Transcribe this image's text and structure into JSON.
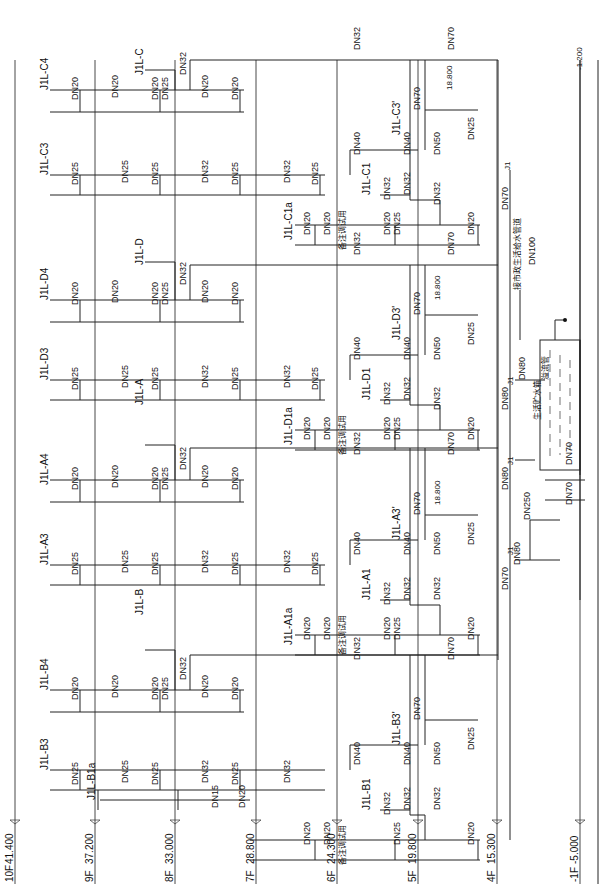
{
  "drawing": {
    "title": "Water supply riser system diagram",
    "floors": [
      {
        "label": "10F",
        "elev": "41.400",
        "x": 15
      },
      {
        "label": "9F",
        "elev": "37.200",
        "x": 95
      },
      {
        "label": "8F",
        "elev": "33.000",
        "x": 175
      },
      {
        "label": "7F",
        "elev": "28.800",
        "x": 256
      },
      {
        "label": "6F",
        "elev": "24.300",
        "x": 337
      },
      {
        "label": "5F",
        "elev": "19.800",
        "x": 418
      },
      {
        "label": "4F",
        "elev": "15.300",
        "x": 497
      },
      {
        "label": "-1F",
        "elev": "-5.000",
        "x": 580
      }
    ],
    "riser_labels": [
      {
        "text": "J1L-C4",
        "x": 48,
        "y": 90
      },
      {
        "text": "J1L-C",
        "x": 143,
        "y": 75
      },
      {
        "text": "J1L-C3",
        "x": 48,
        "y": 175
      },
      {
        "text": "J1L-D",
        "x": 143,
        "y": 265
      },
      {
        "text": "J1L-D4",
        "x": 48,
        "y": 300
      },
      {
        "text": "J1L-D3",
        "x": 48,
        "y": 380
      },
      {
        "text": "J1L-A",
        "x": 143,
        "y": 405
      },
      {
        "text": "J1L-A4",
        "x": 48,
        "y": 485
      },
      {
        "text": "J1L-A3",
        "x": 48,
        "y": 565
      },
      {
        "text": "J1L-B",
        "x": 143,
        "y": 615
      },
      {
        "text": "J1L-B4",
        "x": 48,
        "y": 690
      },
      {
        "text": "J1L-B3",
        "x": 48,
        "y": 770
      },
      {
        "text": "J1L-B1a",
        "x": 95,
        "y": 800
      },
      {
        "text": "J1L-C1a",
        "x": 292,
        "y": 240
      },
      {
        "text": "J1L-C1",
        "x": 370,
        "y": 195
      },
      {
        "text": "J1L-C3'",
        "x": 400,
        "y": 135
      },
      {
        "text": "J1L-D1a",
        "x": 292,
        "y": 445
      },
      {
        "text": "J1L-D1",
        "x": 370,
        "y": 400
      },
      {
        "text": "J1L-D3'",
        "x": 400,
        "y": 340
      },
      {
        "text": "J1L-A1a",
        "x": 292,
        "y": 645
      },
      {
        "text": "J1L-A1",
        "x": 370,
        "y": 600
      },
      {
        "text": "J1L-A3'",
        "x": 400,
        "y": 540
      },
      {
        "text": "J1L-B1",
        "x": 370,
        "y": 810
      },
      {
        "text": "J1L-B3'",
        "x": 400,
        "y": 745
      }
    ],
    "pipe_sizes": [
      {
        "t": "DN20",
        "x": 78,
        "y": 100
      },
      {
        "t": "DN20",
        "x": 118,
        "y": 98
      },
      {
        "t": "DN20",
        "x": 158,
        "y": 100
      },
      {
        "t": "DN25",
        "x": 168,
        "y": 100
      },
      {
        "t": "DN20",
        "x": 208,
        "y": 98
      },
      {
        "t": "DN20",
        "x": 238,
        "y": 100
      },
      {
        "t": "DN32",
        "x": 186,
        "y": 75
      },
      {
        "t": "DN25",
        "x": 78,
        "y": 185
      },
      {
        "t": "DN25",
        "x": 128,
        "y": 183
      },
      {
        "t": "DN25",
        "x": 158,
        "y": 185
      },
      {
        "t": "DN32",
        "x": 208,
        "y": 183
      },
      {
        "t": "DN25",
        "x": 238,
        "y": 185
      },
      {
        "t": "DN32",
        "x": 290,
        "y": 183
      },
      {
        "t": "DN25",
        "x": 318,
        "y": 185
      },
      {
        "t": "DN20",
        "x": 78,
        "y": 305
      },
      {
        "t": "DN20",
        "x": 118,
        "y": 303
      },
      {
        "t": "DN20",
        "x": 158,
        "y": 305
      },
      {
        "t": "DN25",
        "x": 168,
        "y": 305
      },
      {
        "t": "DN20",
        "x": 208,
        "y": 303
      },
      {
        "t": "DN20",
        "x": 238,
        "y": 305
      },
      {
        "t": "DN32",
        "x": 186,
        "y": 285
      },
      {
        "t": "DN25",
        "x": 78,
        "y": 390
      },
      {
        "t": "DN25",
        "x": 128,
        "y": 388
      },
      {
        "t": "DN25",
        "x": 158,
        "y": 390
      },
      {
        "t": "DN32",
        "x": 208,
        "y": 388
      },
      {
        "t": "DN25",
        "x": 238,
        "y": 390
      },
      {
        "t": "DN32",
        "x": 290,
        "y": 388
      },
      {
        "t": "DN25",
        "x": 318,
        "y": 390
      },
      {
        "t": "DN20",
        "x": 78,
        "y": 490
      },
      {
        "t": "DN20",
        "x": 118,
        "y": 488
      },
      {
        "t": "DN20",
        "x": 158,
        "y": 490
      },
      {
        "t": "DN25",
        "x": 168,
        "y": 490
      },
      {
        "t": "DN20",
        "x": 208,
        "y": 488
      },
      {
        "t": "DN20",
        "x": 238,
        "y": 490
      },
      {
        "t": "DN32",
        "x": 186,
        "y": 470
      },
      {
        "t": "DN25",
        "x": 78,
        "y": 575
      },
      {
        "t": "DN25",
        "x": 128,
        "y": 573
      },
      {
        "t": "DN25",
        "x": 158,
        "y": 575
      },
      {
        "t": "DN32",
        "x": 208,
        "y": 573
      },
      {
        "t": "DN25",
        "x": 238,
        "y": 575
      },
      {
        "t": "DN32",
        "x": 290,
        "y": 573
      },
      {
        "t": "DN25",
        "x": 318,
        "y": 575
      },
      {
        "t": "DN20",
        "x": 78,
        "y": 700
      },
      {
        "t": "DN20",
        "x": 118,
        "y": 698
      },
      {
        "t": "DN20",
        "x": 158,
        "y": 700
      },
      {
        "t": "DN25",
        "x": 168,
        "y": 700
      },
      {
        "t": "DN20",
        "x": 208,
        "y": 698
      },
      {
        "t": "DN20",
        "x": 238,
        "y": 700
      },
      {
        "t": "DN32",
        "x": 186,
        "y": 680
      },
      {
        "t": "DN25",
        "x": 78,
        "y": 785
      },
      {
        "t": "DN25",
        "x": 128,
        "y": 783
      },
      {
        "t": "DN25",
        "x": 158,
        "y": 785
      },
      {
        "t": "DN32",
        "x": 208,
        "y": 783
      },
      {
        "t": "DN25",
        "x": 238,
        "y": 785
      },
      {
        "t": "DN32",
        "x": 290,
        "y": 783
      },
      {
        "t": "DN15",
        "x": 218,
        "y": 808
      },
      {
        "t": "DN20",
        "x": 245,
        "y": 808
      },
      {
        "t": "DN32",
        "x": 360,
        "y": 50
      },
      {
        "t": "DN70",
        "x": 454,
        "y": 50
      },
      {
        "t": "DN70",
        "x": 420,
        "y": 110
      },
      {
        "t": "DN40",
        "x": 410,
        "y": 155
      },
      {
        "t": "DN40",
        "x": 360,
        "y": 155
      },
      {
        "t": "DN50",
        "x": 440,
        "y": 155
      },
      {
        "t": "DN32",
        "x": 410,
        "y": 195
      },
      {
        "t": "DN32",
        "x": 390,
        "y": 200
      },
      {
        "t": "DN32",
        "x": 440,
        "y": 205
      },
      {
        "t": "DN20",
        "x": 330,
        "y": 235
      },
      {
        "t": "DN20",
        "x": 310,
        "y": 235
      },
      {
        "t": "DN20",
        "x": 390,
        "y": 235
      },
      {
        "t": "DN25",
        "x": 400,
        "y": 235
      },
      {
        "t": "DN20",
        "x": 474,
        "y": 235
      },
      {
        "t": "DN25",
        "x": 474,
        "y": 140
      },
      {
        "t": "DN32",
        "x": 360,
        "y": 255
      },
      {
        "t": "DN70",
        "x": 454,
        "y": 255
      },
      {
        "t": "DN70",
        "x": 420,
        "y": 315
      },
      {
        "t": "DN40",
        "x": 410,
        "y": 360
      },
      {
        "t": "DN40",
        "x": 360,
        "y": 360
      },
      {
        "t": "DN50",
        "x": 440,
        "y": 360
      },
      {
        "t": "DN32",
        "x": 410,
        "y": 400
      },
      {
        "t": "DN32",
        "x": 390,
        "y": 405
      },
      {
        "t": "DN32",
        "x": 440,
        "y": 410
      },
      {
        "t": "DN20",
        "x": 330,
        "y": 440
      },
      {
        "t": "DN20",
        "x": 310,
        "y": 440
      },
      {
        "t": "DN20",
        "x": 390,
        "y": 440
      },
      {
        "t": "DN25",
        "x": 400,
        "y": 440
      },
      {
        "t": "DN20",
        "x": 474,
        "y": 440
      },
      {
        "t": "DN25",
        "x": 474,
        "y": 345
      },
      {
        "t": "DN32",
        "x": 360,
        "y": 455
      },
      {
        "t": "DN70",
        "x": 454,
        "y": 455
      },
      {
        "t": "DN70",
        "x": 420,
        "y": 515
      },
      {
        "t": "DN40",
        "x": 410,
        "y": 555
      },
      {
        "t": "DN40",
        "x": 360,
        "y": 555
      },
      {
        "t": "DN50",
        "x": 440,
        "y": 555
      },
      {
        "t": "DN32",
        "x": 410,
        "y": 600
      },
      {
        "t": "DN32",
        "x": 390,
        "y": 605
      },
      {
        "t": "DN32",
        "x": 440,
        "y": 600
      },
      {
        "t": "DN20",
        "x": 330,
        "y": 640
      },
      {
        "t": "DN20",
        "x": 310,
        "y": 640
      },
      {
        "t": "DN20",
        "x": 390,
        "y": 640
      },
      {
        "t": "DN25",
        "x": 400,
        "y": 640
      },
      {
        "t": "DN20",
        "x": 474,
        "y": 640
      },
      {
        "t": "DN25",
        "x": 474,
        "y": 545
      },
      {
        "t": "DN32",
        "x": 360,
        "y": 660
      },
      {
        "t": "DN70",
        "x": 454,
        "y": 660
      },
      {
        "t": "DN70",
        "x": 420,
        "y": 720
      },
      {
        "t": "DN40",
        "x": 410,
        "y": 765
      },
      {
        "t": "DN40",
        "x": 360,
        "y": 765
      },
      {
        "t": "DN50",
        "x": 440,
        "y": 765
      },
      {
        "t": "DN32",
        "x": 410,
        "y": 810
      },
      {
        "t": "DN32",
        "x": 390,
        "y": 815
      },
      {
        "t": "DN32",
        "x": 440,
        "y": 810
      },
      {
        "t": "DN20",
        "x": 330,
        "y": 845
      },
      {
        "t": "DN20",
        "x": 310,
        "y": 845
      },
      {
        "t": "DN25",
        "x": 400,
        "y": 845
      },
      {
        "t": "DN20",
        "x": 474,
        "y": 845
      },
      {
        "t": "DN25",
        "x": 474,
        "y": 750
      },
      {
        "t": "DN70",
        "x": 508,
        "y": 210
      },
      {
        "t": "DN100",
        "x": 535,
        "y": 265
      },
      {
        "t": "DN80",
        "x": 525,
        "y": 380
      },
      {
        "t": "DN80",
        "x": 508,
        "y": 410
      },
      {
        "t": "DN80",
        "x": 508,
        "y": 490
      },
      {
        "t": "DN250",
        "x": 530,
        "y": 520
      },
      {
        "t": "DN80",
        "x": 520,
        "y": 565
      },
      {
        "t": "DN70",
        "x": 508,
        "y": 590
      },
      {
        "t": "DN70",
        "x": 572,
        "y": 465
      },
      {
        "t": "DN70",
        "x": 572,
        "y": 505
      }
    ],
    "annotations": [
      {
        "t": "18.800",
        "x": 452,
        "y": 90
      },
      {
        "t": "18.800",
        "x": 440,
        "y": 300
      },
      {
        "t": "18.800",
        "x": 440,
        "y": 505
      },
      {
        "t": "-1.200",
        "x": 582,
        "y": 70
      },
      {
        "t": "J1",
        "x": 510,
        "y": 170
      },
      {
        "t": "J1",
        "x": 513,
        "y": 385
      },
      {
        "t": "J1",
        "x": 513,
        "y": 465
      },
      {
        "t": "J1",
        "x": 513,
        "y": 555
      },
      {
        "t": "接市政生活给水管道",
        "x": 520,
        "y": 290
      },
      {
        "t": "生活贮水箱",
        "x": 540,
        "y": 420
      },
      {
        "t": "溢流管",
        "x": 548,
        "y": 380
      },
      {
        "t": "备注调试用",
        "x": 345,
        "y": 250
      },
      {
        "t": "备注调试用",
        "x": 345,
        "y": 455
      },
      {
        "t": "备注调试用",
        "x": 345,
        "y": 655
      },
      {
        "t": "备注调试用",
        "x": 345,
        "y": 865
      }
    ]
  }
}
